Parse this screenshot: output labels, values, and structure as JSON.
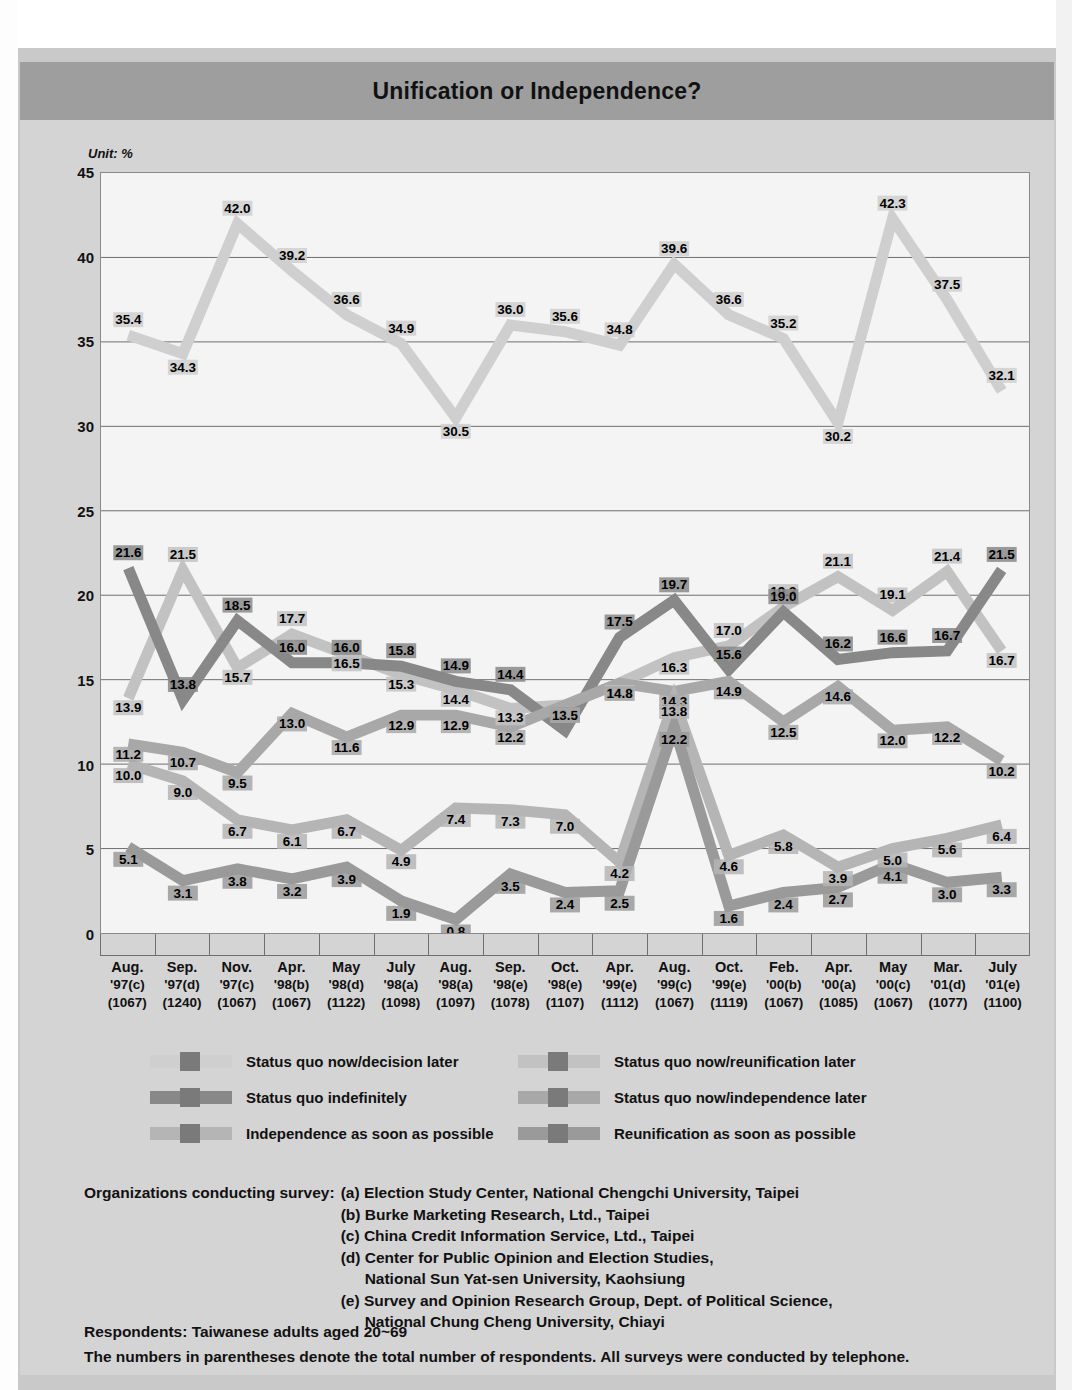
{
  "title": "Unification or Independence?",
  "unit_label": "Unit: %",
  "chart_data": {
    "type": "line",
    "title": "Unification or Independence?",
    "xlabel": "",
    "ylabel": "",
    "unit": "%",
    "ylim": [
      0,
      45
    ],
    "yticks": [
      0,
      5,
      10,
      15,
      20,
      25,
      30,
      35,
      40,
      45
    ],
    "grid": true,
    "legend_position": "below",
    "categories": [
      "Aug. '97(c)",
      "Sep. '97(d)",
      "Nov. '97(c)",
      "Apr. '98(b)",
      "May '98(d)",
      "July '98(a)",
      "Aug. '98(a)",
      "Sep. '98(e)",
      "Oct. '98(e)",
      "Apr. '99(e)",
      "Aug. '99(c)",
      "Oct. '99(e)",
      "Feb. '00(b)",
      "Apr. '00(a)",
      "May '00(c)",
      "Mar. '01(d)",
      "July '01(e)"
    ],
    "x_ticks": [
      {
        "month": "Aug.",
        "year_org": "'97(c)",
        "n": "(1067)"
      },
      {
        "month": "Sep.",
        "year_org": "'97(d)",
        "n": "(1240)"
      },
      {
        "month": "Nov.",
        "year_org": "'97(c)",
        "n": "(1067)"
      },
      {
        "month": "Apr.",
        "year_org": "'98(b)",
        "n": "(1067)"
      },
      {
        "month": "May",
        "year_org": "'98(d)",
        "n": "(1122)"
      },
      {
        "month": "July",
        "year_org": "'98(a)",
        "n": "(1098)"
      },
      {
        "month": "Aug.",
        "year_org": "'98(a)",
        "n": "(1097)"
      },
      {
        "month": "Sep.",
        "year_org": "'98(e)",
        "n": "(1078)"
      },
      {
        "month": "Oct.",
        "year_org": "'98(e)",
        "n": "(1107)"
      },
      {
        "month": "Apr.",
        "year_org": "'99(e)",
        "n": "(1112)"
      },
      {
        "month": "Aug.",
        "year_org": "'99(c)",
        "n": "(1067)"
      },
      {
        "month": "Oct.",
        "year_org": "'99(e)",
        "n": "(1119)"
      },
      {
        "month": "Feb.",
        "year_org": "'00(b)",
        "n": "(1067)"
      },
      {
        "month": "Apr.",
        "year_org": "'00(a)",
        "n": "(1085)"
      },
      {
        "month": "May",
        "year_org": "'00(c)",
        "n": "(1067)"
      },
      {
        "month": "Mar.",
        "year_org": "'01(d)",
        "n": "(1077)"
      },
      {
        "month": "July",
        "year_org": "'01(e)",
        "n": "(1100)"
      }
    ],
    "series": [
      {
        "name": "Status quo now/decision later",
        "color": "#cfcfcf",
        "values": [
          35.4,
          34.3,
          42.0,
          39.2,
          36.6,
          34.9,
          30.5,
          36.0,
          35.6,
          34.8,
          39.6,
          36.6,
          35.2,
          30.2,
          42.3,
          37.5,
          32.1
        ]
      },
      {
        "name": "Status quo now/reunification later",
        "color": "#c2c2c2",
        "values": [
          13.9,
          21.5,
          15.7,
          17.7,
          16.5,
          15.3,
          14.4,
          13.3,
          13.5,
          14.8,
          16.3,
          17.0,
          19.3,
          21.1,
          19.1,
          21.4,
          16.7
        ]
      },
      {
        "name": "Status quo indefinitely",
        "color": "#888888",
        "values": [
          21.6,
          13.8,
          18.5,
          16.0,
          16.0,
          15.8,
          14.9,
          14.4,
          12.0,
          17.5,
          19.7,
          15.6,
          19.0,
          16.2,
          16.6,
          16.7,
          21.5
        ]
      },
      {
        "name": "Status quo now/independence later",
        "color": "#a8a8a8",
        "values": [
          11.2,
          10.7,
          9.5,
          13.0,
          11.6,
          12.9,
          12.9,
          12.2,
          13.5,
          14.8,
          14.3,
          14.9,
          12.5,
          14.6,
          12.0,
          12.2,
          10.2
        ]
      },
      {
        "name": "Independence as soon as possible",
        "color": "#b5b5b5",
        "values": [
          10.0,
          9.0,
          6.7,
          6.1,
          6.7,
          4.9,
          7.4,
          7.3,
          7.0,
          4.2,
          13.8,
          4.6,
          5.8,
          3.9,
          5.0,
          5.6,
          6.4
        ]
      },
      {
        "name": "Reunification as soon as possible",
        "color": "#9a9a9a",
        "values": [
          5.1,
          3.1,
          3.8,
          3.2,
          3.9,
          1.9,
          0.8,
          3.5,
          2.4,
          2.5,
          12.2,
          1.6,
          2.4,
          2.7,
          4.1,
          3.0,
          3.3
        ]
      }
    ]
  },
  "legend": [
    {
      "label": "Status quo now/decision later",
      "color": "#cfcfcf"
    },
    {
      "label": "Status quo now/reunification later",
      "color": "#c2c2c2"
    },
    {
      "label": "Status quo indefinitely",
      "color": "#888888"
    },
    {
      "label": "Status quo now/independence later",
      "color": "#a8a8a8"
    },
    {
      "label": "Independence as soon as possible",
      "color": "#b5b5b5"
    },
    {
      "label": "Reunification as soon as possible",
      "color": "#9a9a9a"
    }
  ],
  "notes": {
    "org_heading": "Organizations conducting survey:",
    "organizations": [
      "(a) Election Study Center, National Chengchi University, Taipei",
      "(b) Burke Marketing Research, Ltd., Taipei",
      "(c) China Credit Information Service, Ltd., Taipei",
      "(d) Center for Public Opinion and Election Studies,",
      "National Sun Yat-sen University, Kaohsiung",
      "(e) Survey and Opinion Research Group, Dept. of Political Science,",
      "National Chung Cheng University, Chiayi"
    ],
    "respondents": "Respondents: Taiwanese adults aged 20~69",
    "parentheses_note": "The numbers in parentheses denote the total number of respondents. All surveys were conducted by telephone."
  }
}
